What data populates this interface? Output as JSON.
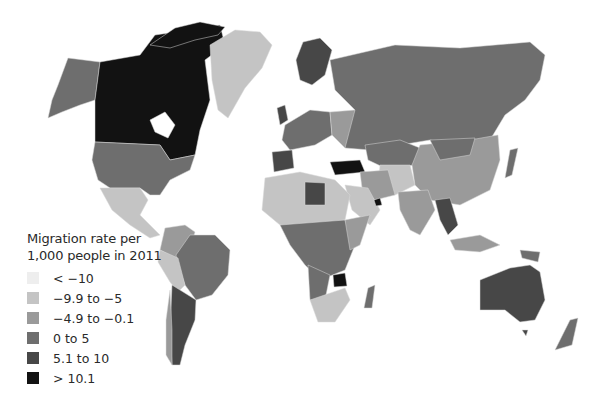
{
  "legend": {
    "title_line1": "Migration rate per",
    "title_line2": "1,000 people in 2011",
    "items": [
      {
        "label": "< −10",
        "color": "#eeeeee"
      },
      {
        "label": "−9.9 to −5",
        "color": "#c4c4c4"
      },
      {
        "label": "−4.9 to −0.1",
        "color": "#9a9a9a"
      },
      {
        "label": "0 to 5",
        "color": "#6e6e6e"
      },
      {
        "label": "5.1 to 10",
        "color": "#474747"
      },
      {
        "label": "> 10.1",
        "color": "#121212"
      }
    ]
  },
  "regions": [
    {
      "name": "Canada",
      "class": "> 10.1"
    },
    {
      "name": "Alaska/USA",
      "class": "0 to 5"
    },
    {
      "name": "Greenland",
      "class": "−9.9 to −5"
    },
    {
      "name": "Mexico",
      "class": "−9.9 to −5"
    },
    {
      "name": "Russia",
      "class": "0 to 5"
    },
    {
      "name": "China",
      "class": "−4.9 to −0.1"
    },
    {
      "name": "Australia",
      "class": "5.1 to 10"
    },
    {
      "name": "Zimbabwe",
      "class": "> 10.1"
    },
    {
      "name": "Argentina",
      "class": "5.1 to 10"
    },
    {
      "name": "Brazil",
      "class": "0 to 5"
    }
  ]
}
